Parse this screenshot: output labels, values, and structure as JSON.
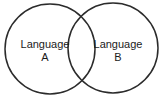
{
  "figure": {
    "type": "venn-diagram",
    "background_color": "#ffffff",
    "stroke_color": "#2b2b2b",
    "text_color": "#1b1b1b",
    "set_count": 2
  },
  "sets": [
    {
      "id": "set-a",
      "label_line1": "Language",
      "label_line2": "A",
      "full_label": "Language A",
      "center_x": 50,
      "center_y": 49,
      "radius": 45,
      "label_x": 45,
      "label_y_line1": 48,
      "label_y_line2": 61
    },
    {
      "id": "set-b",
      "label_line1": "Language",
      "label_line2": "B",
      "full_label": "Language B",
      "center_x": 113,
      "center_y": 48,
      "radius": 45,
      "label_x": 118,
      "label_y_line1": 48,
      "label_y_line2": 61
    }
  ]
}
